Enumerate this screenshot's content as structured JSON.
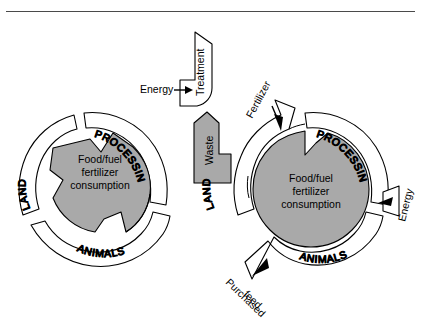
{
  "figure": {
    "domain": "diagram",
    "kind": "two-panel nutrient-cycle rosette diagram",
    "background_color": "#ffffff",
    "rule_color": "#4a4a4a",
    "outline_color": "#000000",
    "fill_gray": "#a9a9a9",
    "fill_white": "#ffffff"
  },
  "left_panel": {
    "name": "closed-cycle-system",
    "center_label_lines": [
      "Food/fuel",
      "fertilizer",
      "consumption"
    ],
    "sectors": [
      {
        "id": "land",
        "label": "LAND"
      },
      {
        "id": "processing",
        "label": "PROCESSING"
      },
      {
        "id": "animals",
        "label": "ANIMALS"
      }
    ]
  },
  "right_panel": {
    "name": "open-cycle-system",
    "center_label_lines": [
      "Food/fuel",
      "fertilizer",
      "consumption"
    ],
    "sectors": [
      {
        "id": "land",
        "label": "LAND"
      },
      {
        "id": "processing",
        "label": "PROCESSING"
      },
      {
        "id": "animals",
        "label": "ANIMALS"
      }
    ],
    "flows": [
      {
        "id": "fertilizer",
        "label": "Fertilizer",
        "direction": "in"
      },
      {
        "id": "energy",
        "label": "Energy",
        "direction": "in"
      },
      {
        "id": "purchased-feed",
        "label": "Purchased\nfeed",
        "direction": "in"
      }
    ]
  },
  "treatment_block": {
    "label": "Treatment",
    "input_label": "Energy"
  },
  "waste_block": {
    "label": "Waste"
  },
  "labels": {
    "treatment": "Treatment",
    "waste": "Waste",
    "energy_top": "Energy",
    "energy_right": "Energy",
    "fertilizer": "Fertilizer",
    "purchased_feed_line1": "Purchased",
    "purchased_feed_line2": "feed",
    "land": "LAND",
    "processing": "PROCESSING",
    "animals": "ANIMALS",
    "center_line1": "Food/fuel",
    "center_line2": "fertilizer",
    "center_line3": "consumption"
  }
}
